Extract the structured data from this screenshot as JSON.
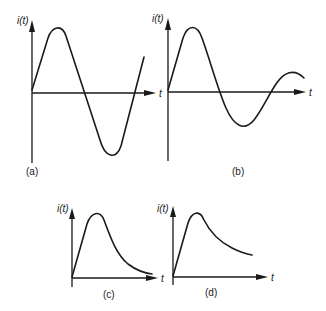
{
  "figure": {
    "panels": [
      {
        "id": "a",
        "caption": "(a)",
        "ylabel": "i(t)",
        "xlabel": "t",
        "description": "Undamped sinusoidal current starting at zero"
      },
      {
        "id": "b",
        "caption": "(b)",
        "ylabel": "i(t)",
        "xlabel": "t",
        "description": "Damped (decaying) sinusoidal current"
      },
      {
        "id": "c",
        "caption": "(c)",
        "ylabel": "i(t)",
        "xlabel": "t",
        "description": "Unipolar pulse rising to peak then decaying to near zero"
      },
      {
        "id": "d",
        "caption": "(d)",
        "ylabel": "i(t)",
        "xlabel": "t",
        "description": "Unipolar pulse rising to peak then decaying slowly to a non-zero level"
      }
    ],
    "colors": {
      "ink": "#1a1a1a",
      "background": "#ffffff"
    }
  }
}
